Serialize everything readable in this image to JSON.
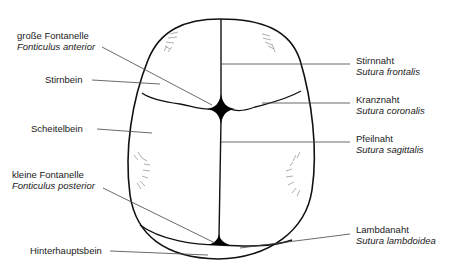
{
  "diagram": {
    "colors": {
      "outline": "#111111",
      "leader": "#444444",
      "hatch": "#9a9a9a",
      "background": "#ffffff"
    },
    "labels_left": [
      {
        "id": "fontanelle-anterior",
        "name": "große Fontanelle",
        "latin": "Fonticulus anterior"
      },
      {
        "id": "stirnbein",
        "name": "Stirnbein",
        "latin": ""
      },
      {
        "id": "scheitelbein",
        "name": "Scheitelbein",
        "latin": ""
      },
      {
        "id": "fontanelle-posterior",
        "name": "kleine Fontanelle",
        "latin": "Fonticulus posterior"
      },
      {
        "id": "hinterhauptsbein",
        "name": "Hinterhauptsbein",
        "latin": ""
      }
    ],
    "labels_right": [
      {
        "id": "sutura-frontalis",
        "name": "Stirnnaht",
        "latin": "Sutura frontalis"
      },
      {
        "id": "sutura-coronalis",
        "name": "Kranznaht",
        "latin": "Sutura coronalis"
      },
      {
        "id": "sutura-sagittalis",
        "name": "Pfeilnaht",
        "latin": "Sutura sagittalis"
      },
      {
        "id": "sutura-lambdoidea",
        "name": "Lambdanaht",
        "latin": "Sutura lambdoidea"
      }
    ]
  }
}
